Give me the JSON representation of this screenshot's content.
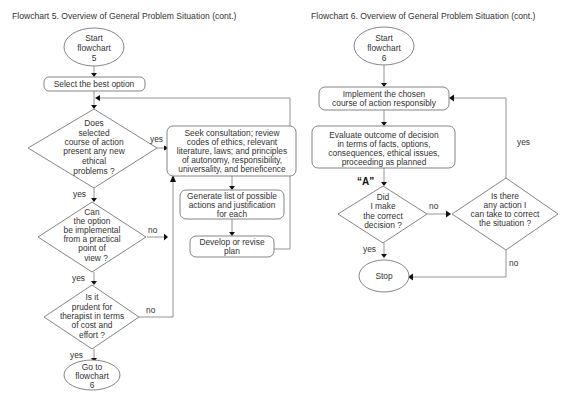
{
  "flowchart5": {
    "title": "Flowchart 5.   Overview of General Problem Situation (cont.)",
    "start": [
      "Start",
      "flowchart",
      "5"
    ],
    "select": "Select the best option",
    "decision1": [
      "Does",
      "selected",
      "course of action",
      "present any new",
      "ethical",
      "problems ?"
    ],
    "decision2": [
      "Can",
      "the option",
      "be implemental",
      "from a practical",
      "point of",
      "view ?"
    ],
    "decision3": [
      "Is it",
      "prudent for",
      "therapist in terms",
      "of cost and",
      "effort ?"
    ],
    "consult": [
      "Seek consultation; review",
      "codes of ethics, relevant",
      "literature, laws; and principles",
      "of autonomy, responsibility,",
      "universality, and beneficence"
    ],
    "generate": [
      "Generate list of possible",
      "actions and justification",
      "for each"
    ],
    "develop": [
      "Develop or revise",
      "plan"
    ],
    "goto": [
      "Go to",
      "flowchart",
      "6"
    ],
    "labels": {
      "yes": "yes",
      "no": "no"
    }
  },
  "flowchart6": {
    "title": "Flowchart 6.   Overview of General Problem Situation (cont.)",
    "start": [
      "Start",
      "flowchart",
      "6"
    ],
    "implement": [
      "Implement the chosen",
      "course of action responsibly"
    ],
    "evaluate": [
      "Evaluate outcome of decision",
      "in terms of facts, options,",
      "consequences, ethical issues,",
      "proceeding as planned"
    ],
    "marker": "“A”",
    "decision1": [
      "Did",
      "I make",
      "the correct",
      "decision ?"
    ],
    "decision2": [
      "Is there",
      "any action I",
      "can take to correct",
      "the situation ?"
    ],
    "stop": "Stop",
    "labels": {
      "yes": "yes",
      "no": "no"
    }
  }
}
